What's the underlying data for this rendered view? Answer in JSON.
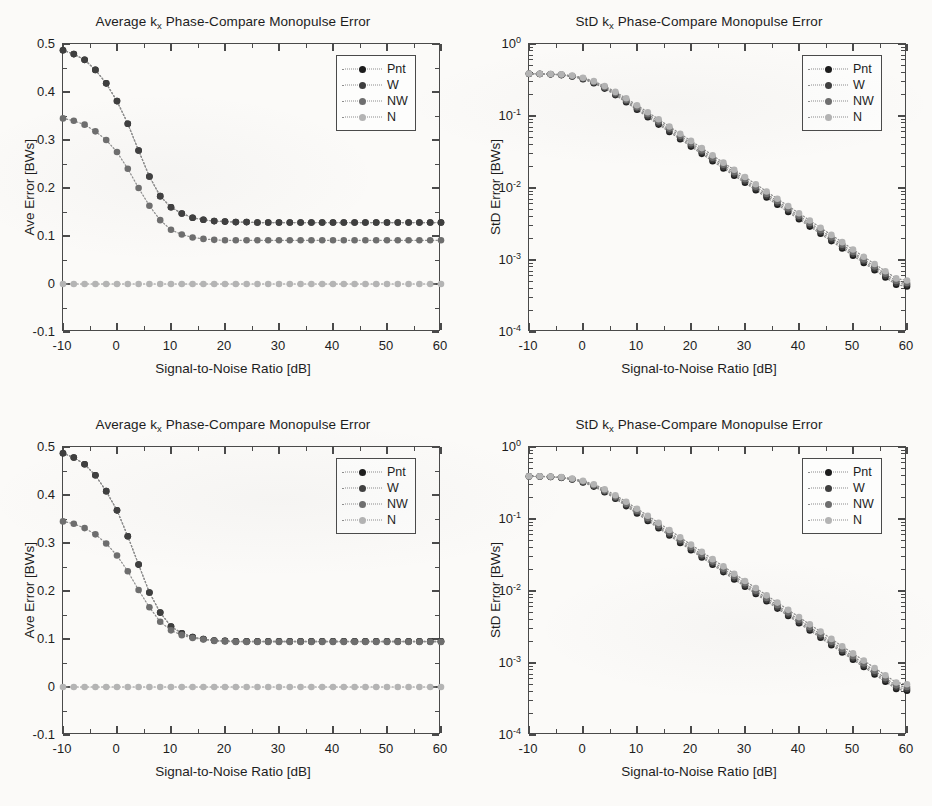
{
  "figure": {
    "background_color": "#fbfaf8",
    "axis_color": "#4a4a4a",
    "text_color": "#1d1d1d",
    "panel_count": 4
  },
  "series_colors": {
    "Pnt": "#1c1c1c",
    "W": "#3f3f3f",
    "NW": "#6e6e6e",
    "N": "#b4b4b4",
    "line": "#8c8c8c"
  },
  "legend": {
    "entries": [
      {
        "label": "Pnt",
        "color": "#1c1c1c"
      },
      {
        "label": "W",
        "color": "#3f3f3f"
      },
      {
        "label": "NW",
        "color": "#6e6e6e"
      },
      {
        "label": "N",
        "color": "#b4b4b4"
      }
    ]
  },
  "panels": [
    {
      "id": "top-left",
      "title_prefix": "Average k",
      "title_sub": "x",
      "title_suffix": " Phase-Compare Monopulse Error",
      "title_full": "Average k_x Phase-Compare Monopulse Error"
    },
    {
      "id": "top-right",
      "title_prefix": "StD k",
      "title_sub": "x",
      "title_suffix": " Phase-Compare Monopulse Error",
      "title_full": "StD k_x Phase-Compare Monopulse Error"
    },
    {
      "id": "bottom-left",
      "title_prefix": "Average k",
      "title_sub": "x",
      "title_suffix": " Phase-Compare Monopulse Error",
      "title_full": "Average k_x Phase-Compare Monopulse Error"
    },
    {
      "id": "bottom-right",
      "title_prefix": "StD k",
      "title_sub": "x",
      "title_suffix": " Phase-Compare Monopulse Error",
      "title_full": "StD k_x Phase-Compare Monopulse Error"
    }
  ],
  "chart_data": [
    {
      "panel": "top-left",
      "type": "line",
      "title": "Average k_x Phase-Compare Monopulse Error",
      "xlabel": "Signal-to-Noise Ratio [dB]",
      "ylabel": "Ave Error [BWs]",
      "xscale": "linear",
      "yscale": "linear",
      "xlim": [
        -10,
        60
      ],
      "ylim": [
        -0.1,
        0.5
      ],
      "xticks": [
        -10,
        0,
        10,
        20,
        30,
        40,
        50,
        60
      ],
      "xticklabels": [
        "-10",
        "0",
        "10",
        "20",
        "30",
        "40",
        "50",
        "60"
      ],
      "yticks": [
        -0.1,
        0,
        0.1,
        0.2,
        0.3,
        0.4,
        0.5
      ],
      "yticklabels": [
        "-0.1",
        "0",
        "0.1",
        "0.2",
        "0.3",
        "0.4",
        "0.5"
      ],
      "grid": false,
      "legend_position": "upper right",
      "marker": "filled-circle",
      "linestyle": "dotted",
      "x": [
        -10,
        -8,
        -6,
        -4,
        -2,
        0,
        2,
        4,
        6,
        8,
        10,
        12,
        14,
        16,
        18,
        20,
        22,
        24,
        26,
        28,
        30,
        32,
        34,
        36,
        38,
        40,
        42,
        44,
        46,
        48,
        50,
        52,
        54,
        56,
        58,
        60
      ],
      "series": [
        {
          "name": "Pnt",
          "color": "#1c1c1c",
          "values": [
            0.487,
            0.479,
            0.467,
            0.446,
            0.418,
            0.381,
            0.334,
            0.278,
            0.224,
            0.183,
            0.16,
            0.147,
            0.138,
            0.134,
            0.131,
            0.13,
            0.129,
            0.129,
            0.128,
            0.128,
            0.128,
            0.128,
            0.128,
            0.128,
            0.128,
            0.128,
            0.128,
            0.128,
            0.128,
            0.128,
            0.128,
            0.128,
            0.128,
            0.128,
            0.128,
            0.128
          ]
        },
        {
          "name": "W",
          "color": "#3f3f3f",
          "values": [
            0.487,
            0.479,
            0.467,
            0.446,
            0.418,
            0.381,
            0.334,
            0.278,
            0.224,
            0.183,
            0.16,
            0.147,
            0.138,
            0.134,
            0.131,
            0.13,
            0.129,
            0.129,
            0.128,
            0.128,
            0.128,
            0.128,
            0.128,
            0.128,
            0.128,
            0.128,
            0.128,
            0.128,
            0.128,
            0.128,
            0.128,
            0.128,
            0.128,
            0.128,
            0.128,
            0.128
          ]
        },
        {
          "name": "NW",
          "color": "#6e6e6e",
          "values": [
            0.345,
            0.34,
            0.332,
            0.318,
            0.3,
            0.275,
            0.24,
            0.2,
            0.163,
            0.133,
            0.113,
            0.103,
            0.097,
            0.094,
            0.092,
            0.091,
            0.091,
            0.091,
            0.091,
            0.091,
            0.091,
            0.091,
            0.091,
            0.091,
            0.091,
            0.091,
            0.091,
            0.091,
            0.091,
            0.091,
            0.091,
            0.091,
            0.091,
            0.091,
            0.091,
            0.091
          ]
        },
        {
          "name": "N",
          "color": "#b4b4b4",
          "values": [
            0,
            0,
            0,
            0,
            0,
            0,
            0,
            0,
            0,
            0,
            0,
            0,
            0,
            0,
            0,
            0,
            0,
            0,
            0,
            0,
            0,
            0,
            0,
            0,
            0,
            0,
            0,
            0,
            0,
            0,
            0,
            0,
            0,
            0,
            0,
            0
          ]
        }
      ]
    },
    {
      "panel": "top-right",
      "type": "line",
      "title": "StD k_x Phase-Compare Monopulse Error",
      "xlabel": "Signal-to-Noise Ratio [dB]",
      "ylabel": "StD Error [BWs]",
      "xscale": "linear",
      "yscale": "log",
      "xlim": [
        -10,
        60
      ],
      "ylim": [
        0.0001,
        1
      ],
      "xticks": [
        -10,
        0,
        10,
        20,
        30,
        40,
        50,
        60
      ],
      "xticklabels": [
        "-10",
        "0",
        "10",
        "20",
        "30",
        "40",
        "50",
        "60"
      ],
      "yticks": [
        1,
        0.1,
        0.01,
        0.001,
        0.0001
      ],
      "yticklabels": [
        "10^0",
        "10^-1",
        "10^-2",
        "10^-3",
        "10^-4"
      ],
      "grid": false,
      "legend_position": "upper right",
      "marker": "filled-circle",
      "linestyle": "dotted",
      "x": [
        -10,
        -8,
        -6,
        -4,
        -2,
        0,
        2,
        4,
        6,
        8,
        10,
        12,
        14,
        16,
        18,
        20,
        22,
        24,
        26,
        28,
        30,
        32,
        34,
        36,
        38,
        40,
        42,
        44,
        46,
        48,
        50,
        52,
        54,
        56,
        58,
        60
      ],
      "series": [
        {
          "name": "Pnt",
          "color": "#1c1c1c",
          "values": [
            0.385,
            0.383,
            0.379,
            0.37,
            0.353,
            0.325,
            0.286,
            0.24,
            0.195,
            0.155,
            0.122,
            0.096,
            0.076,
            0.06,
            0.0476,
            0.0376,
            0.0298,
            0.0236,
            0.0187,
            0.0148,
            0.0118,
            0.00932,
            0.00738,
            0.00585,
            0.00464,
            0.00368,
            0.00291,
            0.00231,
            0.00183,
            0.00145,
            0.00115,
            0.000912,
            0.000723,
            0.000573,
            0.000454,
            0.00043
          ]
        },
        {
          "name": "W",
          "color": "#3f3f3f",
          "values": [
            0.386,
            0.384,
            0.38,
            0.372,
            0.356,
            0.329,
            0.291,
            0.245,
            0.2,
            0.16,
            0.127,
            0.1,
            0.0795,
            0.063,
            0.05,
            0.0396,
            0.0314,
            0.0249,
            0.0197,
            0.0156,
            0.0124,
            0.00983,
            0.00779,
            0.00618,
            0.0049,
            0.00388,
            0.00308,
            0.00244,
            0.00193,
            0.00153,
            0.00122,
            0.000964,
            0.000764,
            0.000606,
            0.00048,
            0.000455
          ]
        },
        {
          "name": "NW",
          "color": "#6e6e6e",
          "values": [
            0.387,
            0.386,
            0.382,
            0.375,
            0.36,
            0.334,
            0.297,
            0.252,
            0.207,
            0.167,
            0.133,
            0.106,
            0.0842,
            0.0668,
            0.053,
            0.042,
            0.0333,
            0.0264,
            0.021,
            0.0166,
            0.0132,
            0.0104,
            0.00827,
            0.00656,
            0.0052,
            0.00412,
            0.00327,
            0.00259,
            0.00206,
            0.00163,
            0.00129,
            0.00102,
            0.000812,
            0.000644,
            0.000511,
            0.00048
          ]
        },
        {
          "name": "N",
          "color": "#b4b4b4",
          "values": [
            0.388,
            0.387,
            0.384,
            0.378,
            0.364,
            0.34,
            0.305,
            0.261,
            0.216,
            0.176,
            0.141,
            0.113,
            0.09,
            0.0715,
            0.0568,
            0.0451,
            0.0358,
            0.0284,
            0.0225,
            0.0179,
            0.0142,
            0.0113,
            0.00893,
            0.00709,
            0.00562,
            0.00446,
            0.00354,
            0.00281,
            0.00223,
            0.00177,
            0.0014,
            0.00111,
            0.000881,
            0.000699,
            0.000555,
            0.00052
          ]
        }
      ]
    },
    {
      "panel": "bottom-left",
      "type": "line",
      "title": "Average k_x Phase-Compare Monopulse Error",
      "xlabel": "Signal-to-Noise Ratio [dB]",
      "ylabel": "Ave Error [BWs]",
      "xscale": "linear",
      "yscale": "linear",
      "xlim": [
        -10,
        60
      ],
      "ylim": [
        -0.1,
        0.5
      ],
      "xticks": [
        -10,
        0,
        10,
        20,
        30,
        40,
        50,
        60
      ],
      "xticklabels": [
        "-10",
        "0",
        "10",
        "20",
        "30",
        "40",
        "50",
        "60"
      ],
      "yticks": [
        -0.1,
        0,
        0.1,
        0.2,
        0.3,
        0.4,
        0.5
      ],
      "yticklabels": [
        "-0.1",
        "0",
        "0.1",
        "0.2",
        "0.3",
        "0.4",
        "0.5"
      ],
      "grid": false,
      "legend_position": "upper right",
      "marker": "filled-circle",
      "linestyle": "dotted",
      "x": [
        -10,
        -8,
        -6,
        -4,
        -2,
        0,
        2,
        4,
        6,
        8,
        10,
        12,
        14,
        16,
        18,
        20,
        22,
        24,
        26,
        28,
        30,
        32,
        34,
        36,
        38,
        40,
        42,
        44,
        46,
        48,
        50,
        52,
        54,
        56,
        58,
        60
      ],
      "series": [
        {
          "name": "Pnt",
          "color": "#1c1c1c",
          "values": [
            0.487,
            0.478,
            0.464,
            0.441,
            0.408,
            0.368,
            0.314,
            0.255,
            0.197,
            0.155,
            0.126,
            0.112,
            0.104,
            0.1,
            0.097,
            0.096,
            0.095,
            0.095,
            0.095,
            0.095,
            0.095,
            0.095,
            0.095,
            0.095,
            0.095,
            0.095,
            0.095,
            0.095,
            0.095,
            0.095,
            0.095,
            0.095,
            0.095,
            0.095,
            0.095,
            0.095
          ]
        },
        {
          "name": "W",
          "color": "#3f3f3f",
          "values": [
            0.487,
            0.478,
            0.464,
            0.441,
            0.408,
            0.368,
            0.314,
            0.255,
            0.197,
            0.155,
            0.126,
            0.112,
            0.104,
            0.1,
            0.097,
            0.096,
            0.095,
            0.095,
            0.095,
            0.095,
            0.095,
            0.095,
            0.095,
            0.095,
            0.095,
            0.095,
            0.095,
            0.095,
            0.095,
            0.095,
            0.095,
            0.095,
            0.095,
            0.095,
            0.095,
            0.095
          ]
        },
        {
          "name": "NW",
          "color": "#6e6e6e",
          "values": [
            0.345,
            0.34,
            0.331,
            0.318,
            0.299,
            0.274,
            0.241,
            0.202,
            0.166,
            0.136,
            0.118,
            0.108,
            0.102,
            0.099,
            0.096,
            0.095,
            0.094,
            0.094,
            0.094,
            0.094,
            0.094,
            0.094,
            0.094,
            0.094,
            0.094,
            0.094,
            0.094,
            0.094,
            0.094,
            0.094,
            0.094,
            0.094,
            0.094,
            0.094,
            0.094,
            0.094
          ]
        },
        {
          "name": "N",
          "color": "#b4b4b4",
          "values": [
            0,
            0,
            0,
            0,
            0,
            0,
            0,
            0,
            0,
            0,
            0,
            0,
            0,
            0,
            0,
            0,
            0,
            0,
            0,
            0,
            0,
            0,
            0,
            0,
            0,
            0,
            0,
            0,
            0,
            0,
            0,
            0,
            0,
            0,
            0,
            0
          ]
        }
      ]
    },
    {
      "panel": "bottom-right",
      "type": "line",
      "title": "StD k_x Phase-Compare Monopulse Error",
      "xlabel": "Signal-to-Noise Ratio [dB]",
      "ylabel": "StD Error [BWs]",
      "xscale": "linear",
      "yscale": "log",
      "xlim": [
        -10,
        60
      ],
      "ylim": [
        0.0001,
        1
      ],
      "xticks": [
        -10,
        0,
        10,
        20,
        30,
        40,
        50,
        60
      ],
      "xticklabels": [
        "-10",
        "0",
        "10",
        "20",
        "30",
        "40",
        "50",
        "60"
      ],
      "yticks": [
        1,
        0.1,
        0.01,
        0.001,
        0.0001
      ],
      "yticklabels": [
        "10^0",
        "10^-1",
        "10^-2",
        "10^-3",
        "10^-4"
      ],
      "grid": false,
      "legend_position": "upper right",
      "marker": "filled-circle",
      "linestyle": "dotted",
      "x": [
        -10,
        -8,
        -6,
        -4,
        -2,
        0,
        2,
        4,
        6,
        8,
        10,
        12,
        14,
        16,
        18,
        20,
        22,
        24,
        26,
        28,
        30,
        32,
        34,
        36,
        38,
        40,
        42,
        44,
        46,
        48,
        50,
        52,
        54,
        56,
        58,
        60
      ],
      "series": [
        {
          "name": "Pnt",
          "color": "#1c1c1c",
          "values": [
            0.39,
            0.388,
            0.383,
            0.373,
            0.353,
            0.322,
            0.282,
            0.236,
            0.191,
            0.151,
            0.119,
            0.094,
            0.0744,
            0.0589,
            0.0466,
            0.0369,
            0.0292,
            0.0231,
            0.0183,
            0.0145,
            0.0115,
            0.0091,
            0.0072,
            0.0057,
            0.00451,
            0.00357,
            0.00283,
            0.00224,
            0.00177,
            0.0014,
            0.00111,
            0.000878,
            0.000695,
            0.00055,
            0.000436,
            0.000412
          ]
        },
        {
          "name": "W",
          "color": "#3f3f3f",
          "values": [
            0.391,
            0.389,
            0.385,
            0.375,
            0.356,
            0.326,
            0.287,
            0.241,
            0.196,
            0.156,
            0.124,
            0.098,
            0.0776,
            0.0615,
            0.0487,
            0.0385,
            0.0305,
            0.0242,
            0.0191,
            0.0152,
            0.012,
            0.00952,
            0.00754,
            0.00597,
            0.00473,
            0.00374,
            0.00296,
            0.00235,
            0.00186,
            0.00147,
            0.00117,
            0.000924,
            0.000732,
            0.00058,
            0.00046,
            0.000436
          ]
        },
        {
          "name": "NW",
          "color": "#6e6e6e",
          "values": [
            0.392,
            0.391,
            0.387,
            0.378,
            0.36,
            0.332,
            0.294,
            0.248,
            0.203,
            0.163,
            0.13,
            0.103,
            0.082,
            0.065,
            0.0515,
            0.0408,
            0.0323,
            0.0256,
            0.0203,
            0.0161,
            0.0128,
            0.0101,
            0.008,
            0.00634,
            0.00502,
            0.00398,
            0.00315,
            0.0025,
            0.00198,
            0.00157,
            0.00124,
            0.000984,
            0.000779,
            0.000617,
            0.000489,
            0.000464
          ]
        },
        {
          "name": "N",
          "color": "#b4b4b4",
          "values": [
            0.393,
            0.392,
            0.389,
            0.382,
            0.366,
            0.34,
            0.304,
            0.259,
            0.214,
            0.174,
            0.139,
            0.111,
            0.0884,
            0.0702,
            0.0557,
            0.0441,
            0.035,
            0.0277,
            0.022,
            0.0174,
            0.0138,
            0.011,
            0.0087,
            0.0069,
            0.00547,
            0.00434,
            0.00344,
            0.00273,
            0.00216,
            0.00171,
            0.00136,
            0.00108,
            0.000854,
            0.000677,
            0.000537,
            0.000508
          ]
        }
      ]
    }
  ]
}
